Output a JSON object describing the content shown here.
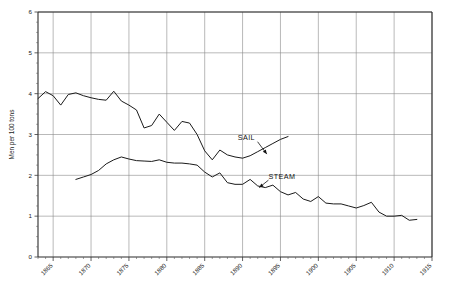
{
  "chart_data": {
    "type": "line",
    "title": "",
    "xlabel": "",
    "ylabel": "Men per 100 tons",
    "xlim": [
      1863,
      1915
    ],
    "ylim": [
      0,
      6
    ],
    "xticks": [
      1865,
      1870,
      1875,
      1880,
      1885,
      1890,
      1895,
      1900,
      1905,
      1910,
      1915
    ],
    "yticks": [
      0,
      1,
      2,
      3,
      4,
      5,
      6
    ],
    "xtick_labels": [
      "1865",
      "1870",
      "1875",
      "1880",
      "1885",
      "1890",
      "1895",
      "1900",
      "1905",
      "1910",
      "1915"
    ],
    "ytick_labels": [
      "0",
      "1",
      "2",
      "3",
      "4",
      "5",
      "6"
    ],
    "grid": true,
    "legend": "annotations-inline",
    "annotations": [
      {
        "text": "SAIL",
        "x": 1890.5,
        "y": 2.86,
        "points_to_x": 1893.2,
        "points_to_y": 2.52
      },
      {
        "text": "STEAM",
        "x": 1895.2,
        "y": 1.92,
        "points_to_x": 1892.2,
        "points_to_y": 1.7
      }
    ],
    "series": [
      {
        "name": "SAIL",
        "x": [
          1863,
          1864,
          1865,
          1866,
          1867,
          1868,
          1869,
          1870,
          1871,
          1872,
          1873,
          1874,
          1875,
          1876,
          1877,
          1878,
          1879,
          1880,
          1881,
          1882,
          1883,
          1884,
          1885,
          1886,
          1887,
          1888,
          1889,
          1890,
          1891,
          1892,
          1893,
          1894,
          1895,
          1896
        ],
        "y": [
          3.88,
          4.05,
          3.95,
          3.72,
          3.98,
          4.02,
          3.95,
          3.9,
          3.86,
          3.84,
          4.06,
          3.82,
          3.72,
          3.6,
          3.16,
          3.22,
          3.5,
          3.3,
          3.1,
          3.32,
          3.28,
          3.0,
          2.6,
          2.38,
          2.62,
          2.5,
          2.45,
          2.42,
          2.48,
          2.58,
          2.68,
          2.78,
          2.88,
          2.95
        ]
      },
      {
        "name": "STEAM",
        "x": [
          1868,
          1869,
          1870,
          1871,
          1872,
          1873,
          1874,
          1875,
          1876,
          1877,
          1878,
          1879,
          1880,
          1881,
          1882,
          1883,
          1884,
          1885,
          1886,
          1887,
          1888,
          1889,
          1890,
          1891,
          1892,
          1893,
          1894,
          1895,
          1896,
          1897,
          1898,
          1899,
          1900,
          1901,
          1902,
          1903,
          1904,
          1905,
          1906,
          1907,
          1908,
          1909,
          1910,
          1911,
          1912,
          1913
        ],
        "y": [
          1.9,
          1.96,
          2.02,
          2.12,
          2.28,
          2.38,
          2.45,
          2.4,
          2.36,
          2.35,
          2.34,
          2.38,
          2.32,
          2.3,
          2.3,
          2.28,
          2.25,
          2.08,
          1.96,
          2.06,
          1.82,
          1.78,
          1.78,
          1.9,
          1.74,
          1.7,
          1.76,
          1.6,
          1.52,
          1.58,
          1.42,
          1.36,
          1.48,
          1.32,
          1.3,
          1.3,
          1.25,
          1.2,
          1.26,
          1.34,
          1.1,
          1.0,
          1.0,
          1.02,
          0.9,
          0.92
        ]
      }
    ]
  }
}
